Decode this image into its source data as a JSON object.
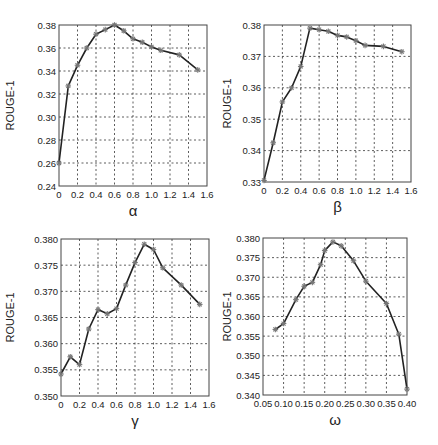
{
  "chart_data": [
    {
      "type": "line",
      "title": "",
      "xlabel": "α",
      "ylabel": "ROUGE-1",
      "xlim": [
        0,
        1.6
      ],
      "ylim": [
        0.24,
        0.38
      ],
      "xticks": [
        "0",
        "0.2",
        "0.4",
        "0.6",
        "0.8",
        "1.0",
        "1.2",
        "1.4",
        "1.6"
      ],
      "yticks": [
        "0.24",
        "0.26",
        "0.28",
        "0.30",
        "0.32",
        "0.34",
        "0.36",
        "0.38"
      ],
      "grid": true,
      "x": [
        0,
        0.1,
        0.2,
        0.3,
        0.4,
        0.5,
        0.6,
        0.7,
        0.8,
        0.9,
        1.0,
        1.1,
        1.3,
        1.5
      ],
      "values": [
        0.26,
        0.327,
        0.345,
        0.36,
        0.372,
        0.376,
        0.38,
        0.375,
        0.368,
        0.365,
        0.361,
        0.358,
        0.354,
        0.341
      ]
    },
    {
      "type": "line",
      "title": "",
      "xlabel": "β",
      "ylabel": "ROUGE-1",
      "xlim": [
        0,
        1.6
      ],
      "ylim": [
        0.33,
        0.38
      ],
      "xticks": [
        "0",
        "0.2",
        "0.4",
        "0.6",
        "0.8",
        "1.0",
        "1.2",
        "1.4",
        "1.6"
      ],
      "yticks": [
        "0.33",
        "0.34",
        "0.35",
        "0.36",
        "0.37",
        "0.38"
      ],
      "grid": true,
      "x": [
        0,
        0.1,
        0.2,
        0.3,
        0.4,
        0.5,
        0.6,
        0.7,
        0.8,
        0.9,
        1.0,
        1.1,
        1.3,
        1.5
      ],
      "values": [
        0.3305,
        0.3425,
        0.3555,
        0.36,
        0.3668,
        0.379,
        0.3785,
        0.378,
        0.3767,
        0.3762,
        0.375,
        0.3735,
        0.3732,
        0.3715
      ]
    },
    {
      "type": "line",
      "title": "",
      "xlabel": "γ",
      "ylabel": "ROUGE-1",
      "xlim": [
        0,
        1.6
      ],
      "ylim": [
        0.35,
        0.38
      ],
      "xticks": [
        "0",
        "0.2",
        "0.4",
        "0.6",
        "0.8",
        "1.0",
        "1.2",
        "1.4",
        "1.6"
      ],
      "yticks": [
        "0.350",
        "0.355",
        "0.360",
        "0.365",
        "0.370",
        "0.375",
        "0.380"
      ],
      "grid": true,
      "x": [
        0,
        0.1,
        0.2,
        0.3,
        0.4,
        0.5,
        0.6,
        0.7,
        0.8,
        0.9,
        1.0,
        1.1,
        1.3,
        1.5
      ],
      "values": [
        0.3542,
        0.3575,
        0.356,
        0.3628,
        0.3665,
        0.3657,
        0.3667,
        0.3712,
        0.3755,
        0.379,
        0.378,
        0.3745,
        0.3712,
        0.3675
      ]
    },
    {
      "type": "line",
      "title": "",
      "xlabel": "ω",
      "ylabel": "ROUGE-1",
      "xlim": [
        0.05,
        0.4
      ],
      "ylim": [
        0.34,
        0.38
      ],
      "xticks": [
        "0.05",
        "0.10",
        "0.15",
        "0.20",
        "0.25",
        "0.30",
        "0.35",
        "0.40"
      ],
      "yticks": [
        "0.340",
        "0.345",
        "0.350",
        "0.355",
        "0.360",
        "0.365",
        "0.370",
        "0.375",
        "0.380"
      ],
      "grid": true,
      "x": [
        0.08,
        0.1,
        0.13,
        0.15,
        0.17,
        0.19,
        0.2,
        0.22,
        0.24,
        0.27,
        0.3,
        0.35,
        0.38,
        0.4
      ],
      "values": [
        0.3567,
        0.3582,
        0.3643,
        0.3677,
        0.3687,
        0.3732,
        0.3768,
        0.379,
        0.378,
        0.3742,
        0.369,
        0.3633,
        0.3555,
        0.3415
      ]
    }
  ],
  "layout": {
    "panels": [
      {
        "left": 0,
        "top": 0,
        "plot": {
          "x0": 59,
          "y0": 25,
          "x1": 207,
          "y1": 186
        }
      },
      {
        "left": 219,
        "top": 0,
        "plot": {
          "x0": 45,
          "y0": 25,
          "x1": 192,
          "y1": 182
        }
      },
      {
        "left": 0,
        "top": 220,
        "plot": {
          "x0": 61,
          "y0": 19,
          "x1": 209,
          "y1": 176
        }
      },
      {
        "left": 219,
        "top": 220,
        "plot": {
          "x0": 44,
          "y0": 18,
          "x1": 188,
          "y1": 175
        }
      }
    ]
  }
}
